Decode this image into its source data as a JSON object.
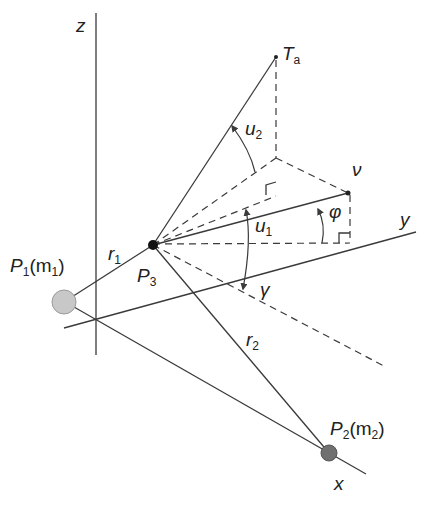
{
  "diagram": {
    "axes": {
      "z": "z",
      "y": "y",
      "x": "x"
    },
    "points": {
      "p1": {
        "name": "P",
        "sub": "1",
        "mass_open": "(m",
        "mass_sub": "1",
        "mass_close": ")"
      },
      "p2": {
        "name": "P",
        "sub": "2",
        "mass_open": "(m",
        "mass_sub": "2",
        "mass_close": ")"
      },
      "p3": {
        "name": "P",
        "sub": "3"
      },
      "ta": {
        "name": "T",
        "sub": "a"
      },
      "v": {
        "name": "ν"
      }
    },
    "distances": {
      "r1": {
        "name": "r",
        "sub": "1"
      },
      "r2": {
        "name": "r",
        "sub": "2"
      }
    },
    "angles": {
      "u1": {
        "name": "u",
        "sub": "1"
      },
      "u2": {
        "name": "u",
        "sub": "2"
      },
      "phi": "φ",
      "gamma": "γ"
    },
    "colors": {
      "line": "#3a3a3a",
      "p1_fill": "#c8c8c8",
      "p2_fill": "#707070",
      "p3_fill": "#111111"
    }
  }
}
